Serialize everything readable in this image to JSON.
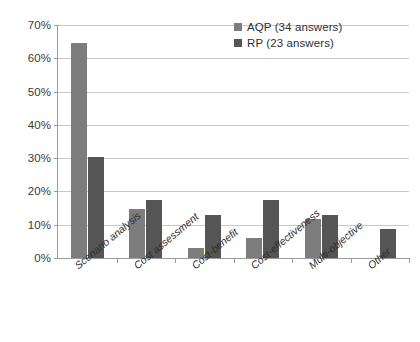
{
  "chart_data": {
    "type": "bar",
    "title": "",
    "subtitle": "",
    "xlabel": "",
    "ylabel": "",
    "categories": [
      "Scenario analysis",
      "Cost assessment",
      "Cost-benefit",
      "Cost-effectiveness",
      "Multi-objective",
      "Other"
    ],
    "series": [
      {
        "name": "AQP  (34 answers)",
        "short_name": "AQP",
        "color": "#7d7d7d",
        "values": [
          64.7,
          14.7,
          2.9,
          5.9,
          11.8,
          0
        ]
      },
      {
        "name": "RP  (23 answers)",
        "short_name": "RP",
        "color": "#555555",
        "values": [
          30.4,
          17.4,
          13.0,
          17.4,
          13.0,
          8.7
        ]
      }
    ],
    "ylim": [
      0,
      70
    ],
    "ytick_step": 10,
    "ytick_labels": [
      "0%",
      "10%",
      "20%",
      "30%",
      "40%",
      "50%",
      "60%",
      "70%"
    ],
    "ytick_values": [
      0,
      10,
      20,
      30,
      40,
      50,
      60,
      70
    ],
    "grid": true,
    "grid_axis": "y",
    "legend_position": "top-right",
    "xtick_rotation": -40
  },
  "legend": {
    "entries": [
      {
        "label": "AQP  (34 answers)",
        "swatch": "aqp"
      },
      {
        "label": "RP  (23 answers)",
        "swatch": "rp"
      }
    ]
  },
  "colors": {
    "series_aqp": "#7d7d7d",
    "series_rp": "#555555",
    "grid": "#c8c8c8",
    "axis": "#9a9a9a",
    "background": "#ffffff",
    "text": "#2f2f2f"
  }
}
